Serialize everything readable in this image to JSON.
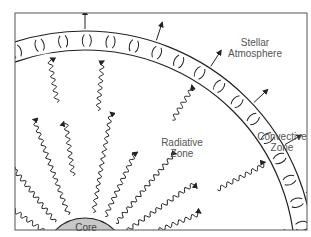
{
  "diagram": {
    "labels": {
      "stellar_atmosphere": [
        "Stellar",
        "Atmosphere"
      ],
      "radiative_zone": [
        "Radiative",
        "Zone"
      ],
      "convective_zone": [
        "Convective",
        "Zone"
      ],
      "core": "Core"
    },
    "colors": {
      "core_fill": "#c8c8c8",
      "stroke": "#222222",
      "text": "#555555",
      "frame": "#555555"
    },
    "elements": {
      "core": "Gray semicircle at bottom-left representing the stellar core",
      "radiative_photons": "Wavy arrows radiating outward from core through the radiative zone",
      "convective_band": "Curved band of circulating convection cells between two concentric arcs",
      "outflow_arrows": "Straight arrows pointing outward from the convective band into the stellar atmosphere"
    }
  }
}
